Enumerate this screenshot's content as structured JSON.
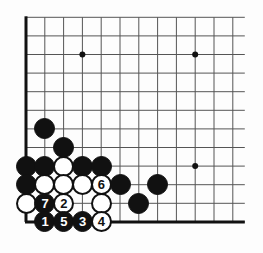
{
  "figure": {
    "kind": "go-board-diagram",
    "title": "",
    "width": 263,
    "height": 253,
    "background_color": "#fdfdfd"
  },
  "board": {
    "corner": "bottom-left",
    "columns": 12,
    "rows": 12,
    "origin_x": 26,
    "origin_y": 17.3,
    "spacing_x": 18.8,
    "spacing_y": 18.6,
    "edge_right_extra": 12,
    "line_color": "#555555",
    "line_width": 1,
    "border_color": "#111111",
    "border_width": 3,
    "border_edges": [
      "left",
      "bottom"
    ],
    "star_point_color": "#111111",
    "star_point_radius": 3,
    "star_points": [
      {
        "col": 3,
        "row": 2
      },
      {
        "col": 9,
        "row": 2
      },
      {
        "col": 9,
        "row": 8
      }
    ]
  },
  "stones": {
    "black_color": "#111111",
    "white_color": "#ffffff",
    "outline_color": "#111111",
    "radius": 10.5,
    "placed": [
      {
        "col": 1,
        "row": 6,
        "color": "black",
        "label": ""
      },
      {
        "col": 2,
        "row": 7,
        "color": "black",
        "label": ""
      },
      {
        "col": 0,
        "row": 8,
        "color": "black",
        "label": ""
      },
      {
        "col": 1,
        "row": 8,
        "color": "black",
        "label": ""
      },
      {
        "col": 2,
        "row": 8,
        "color": "white",
        "label": ""
      },
      {
        "col": 3,
        "row": 8,
        "color": "black",
        "label": ""
      },
      {
        "col": 4,
        "row": 8,
        "color": "black",
        "label": ""
      },
      {
        "col": 0,
        "row": 9,
        "color": "black",
        "label": ""
      },
      {
        "col": 1,
        "row": 9,
        "color": "white",
        "label": ""
      },
      {
        "col": 2,
        "row": 9,
        "color": "white",
        "label": ""
      },
      {
        "col": 3,
        "row": 9,
        "color": "white",
        "label": ""
      },
      {
        "col": 4,
        "row": 9,
        "color": "white",
        "label": "6"
      },
      {
        "col": 5,
        "row": 9,
        "color": "black",
        "label": ""
      },
      {
        "col": 7,
        "row": 9,
        "color": "black",
        "label": ""
      },
      {
        "col": 0,
        "row": 10,
        "color": "white",
        "label": ""
      },
      {
        "col": 1,
        "row": 10,
        "color": "black",
        "label": "7"
      },
      {
        "col": 2,
        "row": 10,
        "color": "white",
        "label": "2"
      },
      {
        "col": 4,
        "row": 10,
        "color": "white",
        "label": ""
      },
      {
        "col": 6,
        "row": 10,
        "color": "black",
        "label": ""
      },
      {
        "col": 1,
        "row": 11,
        "color": "black",
        "label": "1"
      },
      {
        "col": 2,
        "row": 11,
        "color": "black",
        "label": "5"
      },
      {
        "col": 3,
        "row": 11,
        "color": "black",
        "label": "3"
      },
      {
        "col": 4,
        "row": 11,
        "color": "white",
        "label": "4"
      }
    ]
  },
  "move_sequence": [
    {
      "number": "1",
      "color": "black"
    },
    {
      "number": "2",
      "color": "white"
    },
    {
      "number": "3",
      "color": "black"
    },
    {
      "number": "4",
      "color": "white"
    },
    {
      "number": "5",
      "color": "black"
    },
    {
      "number": "6",
      "color": "white"
    },
    {
      "number": "7",
      "color": "black"
    }
  ]
}
